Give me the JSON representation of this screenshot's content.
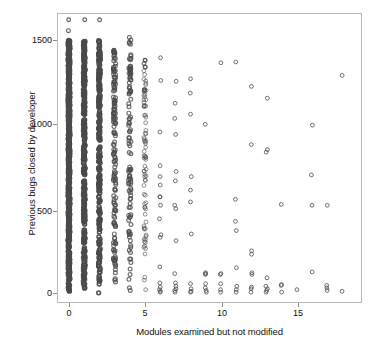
{
  "chart": {
    "xaxis_title": "Modules examined but not modified",
    "yaxis_title": "Previous bugs closed by developer",
    "xticks": [
      "0",
      "5",
      "10",
      "15"
    ],
    "yticks": [
      "0",
      "500",
      "1000",
      "1500"
    ],
    "marker_color": "#4a4a4a",
    "frame_color": "#b9b9b9",
    "background": "#ffffff"
  },
  "chart_data": {
    "type": "scatter",
    "title": "",
    "xlabel": "Modules examined but not modified",
    "ylabel": "Previous bugs closed by developer",
    "xlim": [
      -0.55,
      18.9
    ],
    "ylim": [
      -70,
      1690
    ],
    "xticks": [
      0,
      5,
      10,
      15
    ],
    "yticks": [
      0,
      500,
      1000,
      1500
    ],
    "grid": false,
    "legend": null,
    "marker": "open-circle",
    "marker_size": 4,
    "note": "Heavily overplotted: columns at integer x values. Density falls off sharply as x increases; x=0..3 are near-solid vertical bands spanning 0..1500.",
    "columns": [
      {
        "x": 0,
        "count": 620,
        "y_min": 0,
        "y_max": 1620,
        "density": "solid",
        "extra_y": [
          1620,
          1555
        ]
      },
      {
        "x": 1,
        "count": 330,
        "y_min": 0,
        "y_max": 1620,
        "density": "solid",
        "extra_y": [
          1620,
          1470,
          1430
        ]
      },
      {
        "x": 2,
        "count": 240,
        "y_min": 0,
        "y_max": 1620,
        "density": "solid",
        "extra_y": [
          1620,
          1425,
          1410
        ]
      },
      {
        "x": 3,
        "count": 150,
        "y_min": 0,
        "y_max": 1440,
        "density": "dense",
        "extra_y": [
          1440,
          1345,
          1280
        ]
      },
      {
        "x": 4,
        "count": 105,
        "y_min": 0,
        "y_max": 1515,
        "density": "dense",
        "extra_y": [
          1515,
          1335,
          1215
        ]
      },
      {
        "x": 5,
        "count": 80,
        "y_min": 0,
        "y_max": 1380,
        "density": "medium",
        "extra_y": [
          1380,
          1340,
          1205,
          1110
        ]
      },
      {
        "x": 6,
        "count": 34,
        "y_min": 0,
        "y_max": 1395,
        "density": "sparse",
        "y": [
          1395,
          1260,
          955,
          755,
          690,
          640,
          570,
          570,
          520,
          440,
          345,
          330,
          155,
          60,
          35,
          20,
          10,
          5
        ]
      },
      {
        "x": 7,
        "count": 28,
        "y_min": 0,
        "y_max": 1255,
        "density": "sparse",
        "y": [
          1255,
          1125,
          1035,
          940,
          720,
          665,
          520,
          500,
          310,
          115,
          60,
          40,
          25,
          15,
          5
        ]
      },
      {
        "x": 8,
        "count": 17,
        "y_min": 0,
        "y_max": 1270,
        "density": "sparse",
        "y": [
          1270,
          1185,
          1060,
          690,
          610,
          540,
          350,
          55,
          25,
          10,
          5
        ]
      },
      {
        "x": 9,
        "count": 8,
        "y_min": 0,
        "y_max": 1000,
        "density": "sparse",
        "y": [
          1000,
          120,
          115,
          110,
          55,
          30,
          15,
          5
        ]
      },
      {
        "x": 10,
        "count": 6,
        "y_min": 0,
        "y_max": 1365,
        "density": "sparse",
        "y": [
          1365,
          115,
          110,
          55,
          20,
          5
        ]
      },
      {
        "x": 11,
        "count": 8,
        "y_min": 0,
        "y_max": 1370,
        "density": "sparse",
        "y": [
          1370,
          555,
          425,
          370,
          150,
          40,
          20,
          5
        ]
      },
      {
        "x": 12,
        "count": 9,
        "y_min": 0,
        "y_max": 1225,
        "density": "sparse",
        "y": [
          1225,
          880,
          250,
          230,
          120,
          110,
          35,
          25,
          5
        ]
      },
      {
        "x": 13,
        "count": 8,
        "y_min": 0,
        "y_max": 1155,
        "density": "sparse",
        "y": [
          1155,
          850,
          835,
          90,
          40,
          25,
          15,
          5
        ]
      },
      {
        "x": 14,
        "count": 4,
        "y_min": 5,
        "y_max": 525,
        "density": "sparse",
        "y": [
          525,
          50,
          45,
          5
        ]
      },
      {
        "x": 15,
        "count": 1,
        "y_min": 20,
        "y_max": 20,
        "density": "sparse",
        "y": [
          20
        ]
      },
      {
        "x": 16,
        "count": 4,
        "y_min": 5,
        "y_max": 995,
        "density": "sparse",
        "y": [
          995,
          700,
          520,
          125
        ]
      },
      {
        "x": 17,
        "count": 4,
        "y_min": 5,
        "y_max": 520,
        "density": "sparse",
        "y": [
          520,
          45,
          30,
          15
        ]
      },
      {
        "x": 18,
        "count": 2,
        "y_min": 10,
        "y_max": 1290,
        "density": "sparse",
        "y": [
          1290,
          10
        ]
      }
    ]
  }
}
